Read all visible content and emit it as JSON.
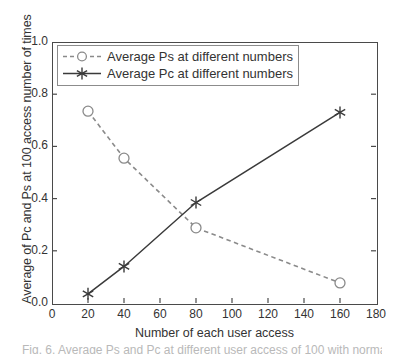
{
  "chart_data": {
    "type": "line",
    "title": "",
    "xlabel": "Number of each user access",
    "ylabel": "Average of Pc and Ps at 100 access number of times",
    "xlim": [
      0,
      180
    ],
    "ylim": [
      0.0,
      1.0
    ],
    "xticks": [
      0,
      20,
      40,
      60,
      80,
      100,
      120,
      140,
      160,
      180
    ],
    "xtick_labels": [
      "0",
      "20",
      "40",
      "60",
      "80",
      "100",
      "120",
      "140",
      "160",
      "180"
    ],
    "yticks": [
      0.0,
      0.2,
      0.4,
      0.6,
      0.8,
      1.0
    ],
    "ytick_labels": [
      "0.0",
      "0.2",
      "0.4",
      "0.6",
      "0.8",
      "1.0"
    ],
    "grid": false,
    "legend_position": "upper left",
    "series": [
      {
        "name": "Average Ps  at different numbers",
        "marker": "open-circle",
        "linestyle": "dashed",
        "color": "#8a8a8a",
        "x": [
          20,
          40,
          80,
          160
        ],
        "values": [
          0.735,
          0.555,
          0.288,
          0.077
        ]
      },
      {
        "name": "Average Pc  at different numbers",
        "marker": "asterisk",
        "linestyle": "solid",
        "color": "#3a3a3a",
        "x": [
          20,
          40,
          80,
          160
        ],
        "values": [
          0.035,
          0.14,
          0.385,
          0.73
        ]
      }
    ]
  },
  "legend": {
    "entries": [
      {
        "label": "Average Ps  at different numbers"
      },
      {
        "label": "Average Pc  at different numbers"
      }
    ]
  },
  "caption": {
    "remnant": "Fig. 6.   Average Ps and Pc at different user access of 100 with normal"
  },
  "colors": {
    "axis": "#4a4a4a",
    "series_ps": "#8a8a8a",
    "series_pc": "#3a3a3a",
    "text": "#333333",
    "background": "#ffffff"
  }
}
